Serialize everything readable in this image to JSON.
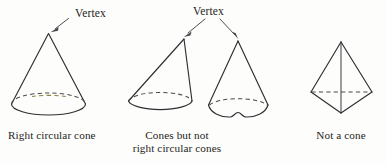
{
  "figure": {
    "title_present": false,
    "background_color": "#fdfdfc",
    "ink_color": "#2e2f33",
    "hidden_edge_color": "#4a4b46",
    "hidden_edge_tint_color": "#8a8247"
  },
  "annotations": {
    "vertex_left": {
      "label": "Vertex",
      "points_to": "right-circular-cone-apex"
    },
    "vertex_middle": {
      "label": "Vertex",
      "points_to": "oblique-cone-apex and wavy-base-cone-apex"
    }
  },
  "captions": {
    "left": {
      "lines": [
        "Right circular cone"
      ]
    },
    "middle": {
      "line1": "Cones but not",
      "line2": "right circular cones"
    },
    "right": {
      "lines": [
        "Not a cone"
      ]
    }
  },
  "shapes": [
    {
      "name": "right-circular-cone",
      "kind": "cone",
      "apex": [
        48,
        33
      ],
      "base_center": [
        48,
        104
      ],
      "base_rx": 37,
      "base_ry": 10.5,
      "caption": "Right circular cone"
    },
    {
      "name": "oblique-cone",
      "kind": "cone",
      "apex": [
        184,
        38
      ],
      "base_center": [
        160,
        101
      ],
      "base_rx": 32,
      "base_ry": 9.5,
      "caption": "Cones but not right circular cones"
    },
    {
      "name": "wavy-base-cone",
      "kind": "cone",
      "apex": [
        238,
        40
      ],
      "base_center": [
        238,
        104
      ],
      "base_rx": 32,
      "base_ry": 9,
      "caption": "Cones but not right circular cones"
    },
    {
      "name": "tetrahedron",
      "kind": "pyramid",
      "apex": [
        341,
        42
      ],
      "left_vertex": [
        311,
        92
      ],
      "right_vertex": [
        372,
        92
      ],
      "bottom_vertex": [
        341,
        113
      ],
      "caption": "Not a cone"
    }
  ]
}
